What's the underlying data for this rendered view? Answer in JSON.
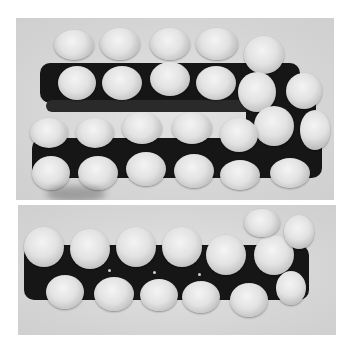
{
  "figure": {
    "panels": [
      {
        "id": "top",
        "content": "Space-filling model, stacked double chain view"
      },
      {
        "id": "bottom",
        "content": "Space-filling model, single chain side view"
      }
    ]
  },
  "colors": {
    "background": "#ffffff",
    "panel": "#d8d8d8",
    "backbone": "#161616",
    "sphere": "#e6e6e6"
  }
}
